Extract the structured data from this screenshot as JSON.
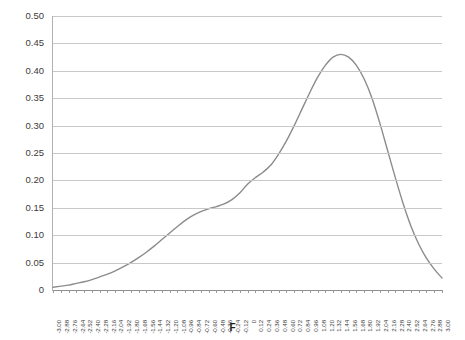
{
  "chart_data": {
    "type": "line",
    "title": "",
    "xlabel": "F",
    "ylabel": "",
    "ylim": [
      0,
      0.5
    ],
    "xlim": [
      -3.0,
      3.0
    ],
    "grid": true,
    "legend": false,
    "legend_position": "none",
    "line_color": "#8c8c8c",
    "grid_color": "#c8c8c8",
    "axis_color": "#b0b0b0",
    "text_color": "#3b3b3b",
    "y_ticks": [
      "0",
      "0.05",
      "0.10",
      "0.15",
      "0.20",
      "0.25",
      "0.30",
      "0.35",
      "0.40",
      "0.45",
      "0.50"
    ],
    "y_tick_values": [
      0,
      0.05,
      0.1,
      0.15,
      0.2,
      0.25,
      0.3,
      0.35,
      0.4,
      0.45,
      0.5
    ],
    "categories": [
      "-3.00",
      "-2.88",
      "-2.76",
      "-2.64",
      "-2.52",
      "-2.40",
      "-2.28",
      "-2.16",
      "-2.04",
      "-1.92",
      "-1.80",
      "-1.68",
      "-1.56",
      "-1.44",
      "-1.32",
      "-1.20",
      "-1.08",
      "-0.96",
      "-0.84",
      "-0.72",
      "-0.60",
      "-0.48",
      "-0.36",
      "-0.24",
      "-0.12",
      "0",
      "0.12",
      "0.24",
      "0.36",
      "0.48",
      "0.60",
      "0.72",
      "0.84",
      "0.96",
      "1.08",
      "1.20",
      "1.32",
      "1.44",
      "1.56",
      "1.68",
      "1.80",
      "1.92",
      "2.04",
      "2.16",
      "2.28",
      "2.40",
      "2.52",
      "2.64",
      "2.76",
      "2.88",
      "3.00"
    ],
    "x": [
      -3.0,
      -2.88,
      -2.76,
      -2.64,
      -2.52,
      -2.4,
      -2.28,
      -2.16,
      -2.04,
      -1.92,
      -1.8,
      -1.68,
      -1.56,
      -1.44,
      -1.32,
      -1.2,
      -1.08,
      -0.96,
      -0.84,
      -0.72,
      -0.6,
      -0.48,
      -0.36,
      -0.24,
      -0.12,
      0.0,
      0.12,
      0.24,
      0.36,
      0.48,
      0.6,
      0.72,
      0.84,
      0.96,
      1.08,
      1.2,
      1.32,
      1.44,
      1.56,
      1.68,
      1.8,
      1.92,
      2.04,
      2.16,
      2.28,
      2.4,
      2.52,
      2.64,
      2.76,
      2.88,
      3.0
    ],
    "values": [
      0.005,
      0.007,
      0.009,
      0.012,
      0.015,
      0.019,
      0.024,
      0.029,
      0.035,
      0.042,
      0.05,
      0.059,
      0.069,
      0.08,
      0.092,
      0.104,
      0.116,
      0.127,
      0.136,
      0.143,
      0.148,
      0.152,
      0.157,
      0.165,
      0.177,
      0.193,
      0.205,
      0.215,
      0.228,
      0.248,
      0.272,
      0.3,
      0.33,
      0.36,
      0.388,
      0.41,
      0.425,
      0.43,
      0.425,
      0.41,
      0.385,
      0.35,
      0.305,
      0.255,
      0.205,
      0.158,
      0.117,
      0.084,
      0.058,
      0.038,
      0.022
    ]
  }
}
